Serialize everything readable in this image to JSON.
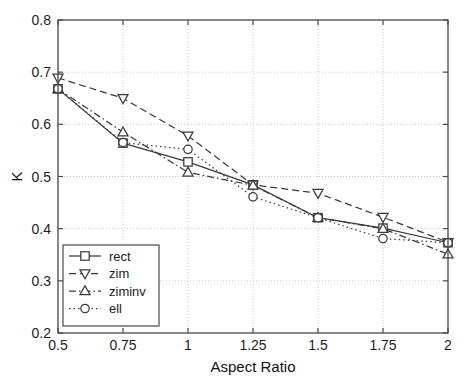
{
  "chart_data": {
    "type": "line",
    "title": "",
    "xlabel": "Aspect Ratio",
    "ylabel": "K",
    "x": [
      0.5,
      0.75,
      1,
      1.25,
      1.5,
      1.75,
      2
    ],
    "xtick_labels": [
      "0.5",
      "0.75",
      "1",
      "1.25",
      "1.5",
      "1.75",
      "2"
    ],
    "ytick_labels": [
      "0.2",
      "0.3",
      "0.4",
      "0.5",
      "0.6",
      "0.7",
      "0.8"
    ],
    "yticks": [
      0.2,
      0.3,
      0.4,
      0.5,
      0.6,
      0.7,
      0.8
    ],
    "xlim": [
      0.5,
      2
    ],
    "ylim": [
      0.2,
      0.8
    ],
    "grid": true,
    "legend_position": "lower left",
    "series": [
      {
        "name": "rect",
        "marker": "square",
        "linestyle": "solid",
        "values": [
          0.668,
          0.564,
          0.528,
          0.484,
          0.421,
          0.401,
          0.373
        ]
      },
      {
        "name": "zim",
        "marker": "triangle-down",
        "linestyle": "dashed",
        "values": [
          0.689,
          0.65,
          0.578,
          0.484,
          0.468,
          0.422,
          0.374
        ]
      },
      {
        "name": "ziminv",
        "marker": "triangle-up",
        "linestyle": "dashdot",
        "values": [
          0.668,
          0.585,
          0.508,
          0.483,
          0.421,
          0.4,
          0.351
        ]
      },
      {
        "name": "ell",
        "marker": "circle",
        "linestyle": "dotted",
        "values": [
          0.668,
          0.565,
          0.552,
          0.461,
          0.421,
          0.381,
          0.373
        ]
      }
    ],
    "colors": {
      "axis": "#4a4a4a",
      "grid": "#c9c9c9",
      "series": "#3a3a3a",
      "background": "#ffffff"
    }
  },
  "legend": {
    "items": [
      {
        "label": "rect"
      },
      {
        "label": "zim"
      },
      {
        "label": "ziminv"
      },
      {
        "label": "ell"
      }
    ]
  }
}
